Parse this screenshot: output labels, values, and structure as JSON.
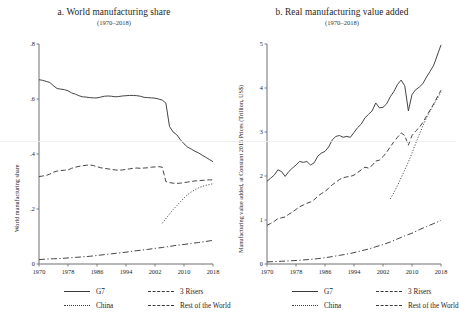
{
  "figure": {
    "panels": [
      {
        "title": "a. World manufacturing share",
        "subtitle": "(1970–2018)",
        "ylabel": "World manufacturing share",
        "yticks": [
          "0",
          ".2",
          ".4",
          ".6",
          ".8"
        ],
        "xticks": [
          "1970",
          "1978",
          "1986",
          "1994",
          "2002",
          "2010",
          "2018"
        ]
      },
      {
        "title": "b. Real manufacturing value added",
        "subtitle": "(1970–2018)",
        "ylabel": "Manufacturing value added, at Constant 2015 Prices (Trillion, US$)",
        "yticks": [
          "0",
          "1",
          "2",
          "3",
          "4",
          "5"
        ],
        "xticks": [
          "1970",
          "1978",
          "1986",
          "1994",
          "2002",
          "2010",
          "2018"
        ]
      }
    ],
    "legend": {
      "entries": [
        {
          "label": "G7",
          "style": "solid"
        },
        {
          "label": "3 Risers",
          "style": "dashed"
        },
        {
          "label": "China",
          "style": "dotted"
        },
        {
          "label": "Rest of the World",
          "style": "dashdot"
        }
      ]
    },
    "line_color": "#3b3b3b",
    "axis_color": "#6f6f6f"
  },
  "chart_data": [
    {
      "type": "line",
      "title": "a. World manufacturing share",
      "subtitle": "(1970–2018)",
      "xlabel": "",
      "ylabel": "World manufacturing share",
      "xlim": [
        1970,
        2018
      ],
      "ylim": [
        0,
        0.8
      ],
      "yticks": [
        0,
        0.2,
        0.4,
        0.6,
        0.8
      ],
      "xticks": [
        1970,
        1978,
        1986,
        1994,
        2002,
        2010,
        2018
      ],
      "grid": false,
      "legend_position": "below",
      "series": [
        {
          "name": "G7",
          "style": "solid",
          "x": [
            1970,
            1971,
            1972,
            1973,
            1974,
            1975,
            1976,
            1977,
            1978,
            1979,
            1980,
            1981,
            1982,
            1983,
            1984,
            1985,
            1986,
            1987,
            1988,
            1989,
            1990,
            1991,
            1992,
            1993,
            1994,
            1995,
            1996,
            1997,
            1998,
            1999,
            2000,
            2001,
            2002,
            2003,
            2004,
            2005,
            2006,
            2007,
            2008,
            2009,
            2010,
            2011,
            2012,
            2013,
            2014,
            2015,
            2016,
            2017,
            2018
          ],
          "y": [
            0.67,
            0.668,
            0.664,
            0.66,
            0.648,
            0.638,
            0.636,
            0.634,
            0.63,
            0.622,
            0.618,
            0.612,
            0.608,
            0.607,
            0.605,
            0.604,
            0.604,
            0.607,
            0.61,
            0.611,
            0.61,
            0.608,
            0.609,
            0.611,
            0.612,
            0.613,
            0.613,
            0.612,
            0.61,
            0.606,
            0.605,
            0.604,
            0.603,
            0.6,
            0.596,
            0.585,
            0.5,
            0.48,
            0.47,
            0.452,
            0.437,
            0.425,
            0.418,
            0.41,
            0.404,
            0.396,
            0.388,
            0.38,
            0.372
          ]
        },
        {
          "name": "3 Risers",
          "style": "dashed",
          "x": [
            1970,
            1971,
            1972,
            1973,
            1974,
            1975,
            1976,
            1977,
            1978,
            1979,
            1980,
            1981,
            1982,
            1983,
            1984,
            1985,
            1986,
            1987,
            1988,
            1989,
            1990,
            1991,
            1992,
            1993,
            1994,
            1995,
            1996,
            1997,
            1998,
            1999,
            2000,
            2001,
            2002,
            2003,
            2004,
            2005,
            2006,
            2007,
            2008,
            2009,
            2010,
            2011,
            2012,
            2013,
            2014,
            2015,
            2016,
            2017,
            2018
          ],
          "y": [
            0.318,
            0.32,
            0.322,
            0.327,
            0.334,
            0.338,
            0.34,
            0.341,
            0.342,
            0.348,
            0.352,
            0.355,
            0.357,
            0.359,
            0.36,
            0.358,
            0.354,
            0.35,
            0.348,
            0.346,
            0.344,
            0.342,
            0.341,
            0.342,
            0.344,
            0.346,
            0.348,
            0.349,
            0.348,
            0.349,
            0.35,
            0.352,
            0.353,
            0.354,
            0.352,
            0.3,
            0.296,
            0.294,
            0.293,
            0.294,
            0.296,
            0.298,
            0.3,
            0.302,
            0.303,
            0.304,
            0.305,
            0.306,
            0.306
          ]
        },
        {
          "name": "China",
          "style": "dotted",
          "x": [
            2004,
            2005,
            2006,
            2007,
            2008,
            2009,
            2010,
            2011,
            2012,
            2013,
            2014,
            2015,
            2016,
            2017,
            2018
          ],
          "y": [
            0.148,
            0.165,
            0.182,
            0.198,
            0.212,
            0.226,
            0.24,
            0.252,
            0.262,
            0.27,
            0.277,
            0.282,
            0.286,
            0.289,
            0.292
          ]
        },
        {
          "name": "Rest of the World",
          "style": "dashdot",
          "x": [
            1970,
            1972,
            1974,
            1976,
            1978,
            1980,
            1982,
            1984,
            1986,
            1988,
            1990,
            1992,
            1994,
            1996,
            1998,
            2000,
            2002,
            2004,
            2006,
            2008,
            2010,
            2012,
            2014,
            2016,
            2018
          ],
          "y": [
            0.016,
            0.018,
            0.019,
            0.02,
            0.022,
            0.024,
            0.026,
            0.028,
            0.031,
            0.034,
            0.037,
            0.04,
            0.043,
            0.047,
            0.05,
            0.053,
            0.057,
            0.06,
            0.064,
            0.068,
            0.071,
            0.075,
            0.078,
            0.082,
            0.086
          ]
        }
      ]
    },
    {
      "type": "line",
      "title": "b. Real manufacturing value added",
      "subtitle": "(1970–2018)",
      "xlabel": "",
      "ylabel": "Manufacturing value added, at Constant 2015 Prices (Trillion, US$)",
      "xlim": [
        1970,
        2018
      ],
      "ylim": [
        0,
        5
      ],
      "yticks": [
        0,
        1,
        2,
        3,
        4,
        5
      ],
      "xticks": [
        1970,
        1978,
        1986,
        1994,
        2002,
        2010,
        2018
      ],
      "grid": false,
      "legend_position": "below",
      "series": [
        {
          "name": "G7",
          "style": "solid",
          "x": [
            1970,
            1971,
            1972,
            1973,
            1974,
            1975,
            1976,
            1977,
            1978,
            1979,
            1980,
            1981,
            1982,
            1983,
            1984,
            1985,
            1986,
            1987,
            1988,
            1989,
            1990,
            1991,
            1992,
            1993,
            1994,
            1995,
            1996,
            1997,
            1998,
            1999,
            2000,
            2001,
            2002,
            2003,
            2004,
            2005,
            2006,
            2007,
            2008,
            2009,
            2010,
            2011,
            2012,
            2013,
            2014,
            2015,
            2016,
            2017,
            2018
          ],
          "y": [
            1.88,
            1.95,
            2.02,
            2.14,
            2.1,
            1.99,
            2.1,
            2.18,
            2.25,
            2.33,
            2.31,
            2.33,
            2.25,
            2.3,
            2.45,
            2.52,
            2.56,
            2.66,
            2.82,
            2.9,
            2.92,
            2.88,
            2.9,
            2.88,
            2.99,
            3.1,
            3.18,
            3.32,
            3.4,
            3.48,
            3.66,
            3.55,
            3.56,
            3.64,
            3.8,
            3.92,
            4.08,
            4.18,
            4.05,
            3.48,
            3.85,
            3.96,
            4.02,
            4.1,
            4.25,
            4.38,
            4.52,
            4.75,
            4.98
          ]
        },
        {
          "name": "3 Risers",
          "style": "dashed",
          "x": [
            1970,
            1971,
            1972,
            1973,
            1974,
            1975,
            1976,
            1977,
            1978,
            1979,
            1980,
            1981,
            1982,
            1983,
            1984,
            1985,
            1986,
            1987,
            1988,
            1989,
            1990,
            1991,
            1992,
            1993,
            1994,
            1995,
            1996,
            1997,
            1998,
            1999,
            2000,
            2001,
            2002,
            2003,
            2004,
            2005,
            2006,
            2007,
            2008,
            2009,
            2010,
            2011,
            2012,
            2013,
            2014,
            2015,
            2016,
            2017,
            2018
          ],
          "y": [
            0.88,
            0.92,
            0.97,
            1.03,
            1.05,
            1.07,
            1.13,
            1.18,
            1.24,
            1.3,
            1.34,
            1.38,
            1.41,
            1.46,
            1.54,
            1.6,
            1.65,
            1.72,
            1.8,
            1.86,
            1.92,
            1.96,
            1.98,
            1.99,
            2.02,
            2.08,
            2.14,
            2.2,
            2.18,
            2.24,
            2.34,
            2.36,
            2.44,
            2.54,
            2.66,
            2.78,
            2.88,
            2.98,
            2.92,
            2.7,
            2.92,
            3.02,
            3.1,
            3.22,
            3.36,
            3.5,
            3.64,
            3.8,
            3.95
          ]
        },
        {
          "name": "China",
          "style": "dotted",
          "x": [
            2004,
            2005,
            2006,
            2007,
            2008,
            2009,
            2010,
            2011,
            2012,
            2013,
            2014,
            2015,
            2016,
            2017,
            2018
          ],
          "y": [
            1.48,
            1.62,
            1.78,
            1.96,
            2.14,
            2.32,
            2.52,
            2.74,
            2.94,
            3.14,
            3.32,
            3.48,
            3.62,
            3.76,
            3.9
          ]
        },
        {
          "name": "Rest of the World",
          "style": "dashdot",
          "x": [
            1970,
            1972,
            1974,
            1976,
            1978,
            1980,
            1982,
            1984,
            1986,
            1988,
            1990,
            1992,
            1994,
            1996,
            1998,
            2000,
            2002,
            2004,
            2006,
            2008,
            2010,
            2012,
            2014,
            2016,
            2018
          ],
          "y": [
            0.048,
            0.055,
            0.062,
            0.07,
            0.08,
            0.092,
            0.105,
            0.122,
            0.142,
            0.168,
            0.196,
            0.224,
            0.258,
            0.3,
            0.34,
            0.392,
            0.44,
            0.5,
            0.57,
            0.64,
            0.7,
            0.78,
            0.85,
            0.92,
            0.99
          ]
        }
      ]
    }
  ]
}
